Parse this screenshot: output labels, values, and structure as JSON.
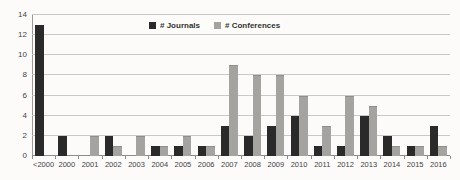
{
  "chart_data": {
    "type": "bar",
    "title": "",
    "xlabel": "",
    "ylabel": "",
    "categories": [
      "<2000",
      "2000",
      "2001",
      "2002",
      "2003",
      "2004",
      "2005",
      "2006",
      "2007",
      "2008",
      "2009",
      "2010",
      "2011",
      "2012",
      "2013",
      "2014",
      "2015",
      "2016"
    ],
    "series": [
      {
        "name": "# Journals",
        "color": "#2a2a2a",
        "values": [
          13,
          2,
          0,
          2,
          0,
          1,
          1,
          1,
          3,
          2,
          3,
          4,
          1,
          1,
          4,
          2,
          1,
          3
        ]
      },
      {
        "name": "# Conferences",
        "color": "#a4a3a0",
        "values": [
          0,
          0,
          2,
          1,
          2,
          1,
          2,
          1,
          9,
          8,
          8,
          6,
          3,
          6,
          5,
          1,
          1,
          1
        ]
      }
    ],
    "ylim": [
      0,
      14
    ],
    "yticks": [
      0,
      2,
      4,
      6,
      8,
      10,
      12,
      14
    ],
    "grid": true,
    "legend_position": "top-center"
  },
  "colors": {
    "journals_bar": "#2a2a2a",
    "conferences_bar": "#a4a3a0",
    "gridline": "#c9c8c4",
    "axis": "#8d8d8d",
    "text": "#3a3a3a",
    "background": "#fcfbf9"
  }
}
